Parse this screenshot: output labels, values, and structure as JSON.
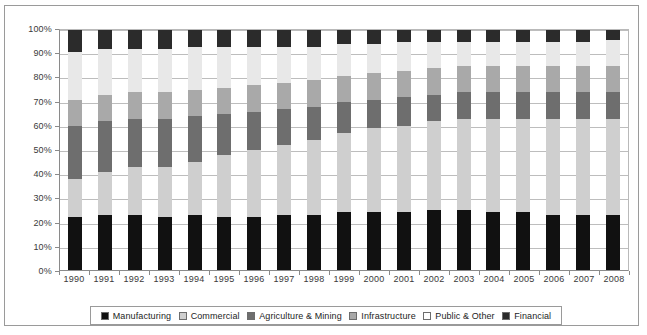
{
  "chart_data": {
    "type": "bar",
    "subtype": "stacked-percentage-column",
    "title": "",
    "subtitle": "",
    "xlabel": "",
    "ylabel": "",
    "ylim": [
      0,
      100
    ],
    "ytick_labels": [
      "0%",
      "10%",
      "20%",
      "30%",
      "40%",
      "50%",
      "60%",
      "70%",
      "80%",
      "90%",
      "100%"
    ],
    "ytick_values": [
      0,
      10,
      20,
      30,
      40,
      50,
      60,
      70,
      80,
      90,
      100
    ],
    "grid": true,
    "legend_position": "bottom",
    "categories": [
      "1990",
      "1991",
      "1992",
      "1993",
      "1994",
      "1995",
      "1996",
      "1997",
      "1998",
      "1999",
      "2000",
      "2001",
      "2002",
      "2003",
      "2004",
      "2005",
      "2006",
      "2007",
      "2008"
    ],
    "series": [
      {
        "name": "Manufacturing",
        "color": "#111111",
        "values": [
          22,
          23,
          23,
          22,
          23,
          22,
          22,
          23,
          23,
          24,
          24,
          24,
          25,
          25,
          24,
          24,
          23,
          23,
          23
        ]
      },
      {
        "name": "Commercial",
        "color": "#cfcfcf",
        "values": [
          16,
          18,
          20,
          21,
          22,
          26,
          28,
          29,
          31,
          33,
          35,
          36,
          37,
          38,
          39,
          39,
          40,
          40,
          40
        ]
      },
      {
        "name": "Agriculture & Mining",
        "color": "#6e6e6e",
        "values": [
          22,
          21,
          20,
          20,
          19,
          17,
          16,
          15,
          14,
          13,
          12,
          12,
          11,
          11,
          11,
          11,
          11,
          11,
          11
        ]
      },
      {
        "name": "Infrastructure",
        "color": "#a9a9a9",
        "values": [
          11,
          11,
          11,
          11,
          11,
          11,
          11,
          11,
          11,
          11,
          11,
          11,
          11,
          11,
          11,
          11,
          11,
          11,
          11
        ]
      },
      {
        "name": "Public & Other",
        "color": "#e8e8e8",
        "values": [
          20,
          19,
          18,
          18,
          18,
          17,
          16,
          15,
          14,
          13,
          12,
          12,
          11,
          10,
          10,
          10,
          10,
          10,
          11
        ]
      },
      {
        "name": "Financial",
        "color": "#2b2b2b",
        "values": [
          9,
          8,
          8,
          8,
          7,
          7,
          7,
          7,
          7,
          6,
          6,
          5,
          5,
          5,
          5,
          5,
          5,
          5,
          4
        ]
      }
    ]
  },
  "legend": {
    "items": [
      {
        "label": "Manufacturing",
        "swatch": "manufacturing"
      },
      {
        "label": "Commercial",
        "swatch": "commercial"
      },
      {
        "label": "Agriculture & Mining",
        "swatch": "agriculture"
      },
      {
        "label": "Infrastructure",
        "swatch": "infrastructure"
      },
      {
        "label": "Public & Other",
        "swatch": "public"
      },
      {
        "label": "Financial",
        "swatch": "financial"
      }
    ]
  }
}
